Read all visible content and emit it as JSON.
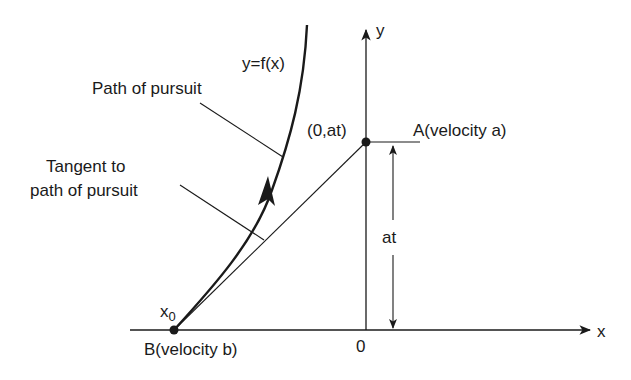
{
  "diagram": {
    "colors": {
      "ink": "#1a1a1a",
      "background": "#ffffff"
    },
    "labels": {
      "curve_eq": "y=f(x)",
      "path_of_pursuit": "Path of pursuit",
      "tangent_line1": "Tangent to",
      "tangent_line2": "path of pursuit",
      "point_a_coords": "(0,at)",
      "point_a": "A(velocity a)",
      "distance": "at",
      "x0": "x",
      "x0_sub": "0",
      "point_b": "B(velocity b)",
      "origin": "0",
      "x_axis": "x",
      "y_axis": "y"
    },
    "elements": [
      {
        "id": "x-axis",
        "type": "arrow",
        "from": [
          130,
          330
        ],
        "to": [
          590,
          330
        ]
      },
      {
        "id": "y-axis",
        "type": "arrow",
        "from": [
          366,
          330
        ],
        "to": [
          366,
          28
        ]
      },
      {
        "id": "pursuit-curve",
        "type": "curve",
        "from": [
          174,
          330
        ],
        "to": [
          307,
          25
        ]
      },
      {
        "id": "tangent-line",
        "type": "line",
        "from": [
          174,
          330
        ],
        "to": [
          366,
          142
        ]
      },
      {
        "id": "point-A",
        "type": "point",
        "at": [
          366,
          142
        ]
      },
      {
        "id": "point-B",
        "type": "point",
        "at": [
          174,
          330
        ]
      },
      {
        "id": "distance-at",
        "type": "double-arrow",
        "from": [
          393,
          145
        ],
        "to": [
          393,
          328
        ]
      }
    ]
  }
}
